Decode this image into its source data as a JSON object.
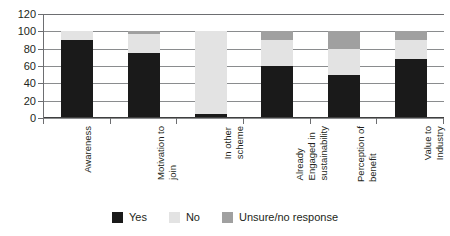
{
  "chart_data": {
    "type": "bar",
    "title": "",
    "subtitle": "",
    "xlabel": "",
    "ylabel": "",
    "ylim": [
      0,
      120
    ],
    "yticks": [
      0,
      20,
      40,
      60,
      80,
      100,
      120
    ],
    "grid": true,
    "stacked": true,
    "legend_position": "bottom",
    "categories": [
      "Awareness",
      "Motivation to join",
      "In other scheme",
      "Already Engaged in sustainability",
      "Perception of benefit",
      "Value to Industry"
    ],
    "category_lines": [
      [
        "Awareness"
      ],
      [
        "Motivation to",
        "join"
      ],
      [
        "In other",
        "scheme"
      ],
      [
        "Already",
        "Engaged in",
        "sustainability"
      ],
      [
        "Perception of",
        "benefit"
      ],
      [
        "Value to",
        "Industry"
      ]
    ],
    "series": [
      {
        "name": "Yes",
        "color": "#1a1a1a",
        "values": [
          90,
          75,
          5,
          60,
          50,
          68
        ]
      },
      {
        "name": "No",
        "color": "#e3e3e3",
        "values": [
          10,
          22,
          95,
          30,
          30,
          22
        ]
      },
      {
        "name": "Unsure/no response",
        "color": "#a0a0a0",
        "values": [
          0,
          3,
          0,
          10,
          20,
          10
        ]
      }
    ]
  },
  "legend": {
    "items": [
      {
        "label": "Yes",
        "color": "#1a1a1a"
      },
      {
        "label": "No",
        "color": "#e3e3e3"
      },
      {
        "label": "Unsure/no response",
        "color": "#a0a0a0"
      }
    ]
  },
  "yticks_text": [
    "120",
    "100",
    "80",
    "60",
    "40",
    "20",
    "0"
  ]
}
